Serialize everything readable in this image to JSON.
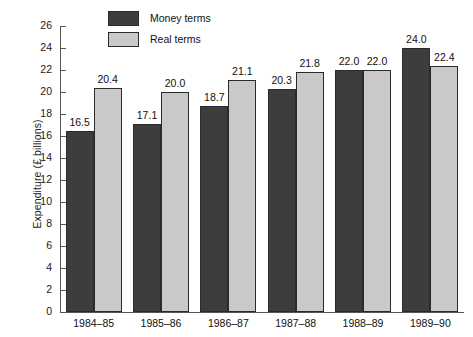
{
  "chart_data": {
    "type": "bar",
    "title": "",
    "xlabel": "",
    "ylabel": "Expenditure (£ billions)",
    "ylim": [
      0,
      26
    ],
    "ytick_step": 2,
    "yticks": [
      0,
      2,
      4,
      6,
      8,
      10,
      12,
      14,
      16,
      18,
      20,
      22,
      24,
      26
    ],
    "grid": false,
    "legend_position": "top-left-inside",
    "categories": [
      "1984–85",
      "1985–86",
      "1986–87",
      "1987–88",
      "1988–89",
      "1989–90"
    ],
    "series": [
      {
        "name": "Money terms",
        "color": "#3d3d3d",
        "values": [
          16.5,
          17.1,
          18.7,
          20.3,
          22.0,
          24.0
        ],
        "labels": [
          "16.5",
          "17.1",
          "18.7",
          "20.3",
          "22.0",
          "24.0"
        ]
      },
      {
        "name": "Real terms",
        "color": "#c9c9c9",
        "values": [
          20.4,
          20.0,
          21.1,
          21.8,
          22.0,
          22.4
        ],
        "labels": [
          "20.4",
          "20.0",
          "21.1",
          "21.8",
          "22.0",
          "22.4"
        ]
      }
    ]
  },
  "legend": {
    "items": [
      {
        "label": "Money terms",
        "swatch": "money"
      },
      {
        "label": "Real terms",
        "swatch": "real"
      }
    ]
  },
  "axis": {
    "y_title": "Expenditure (£ billions)"
  }
}
